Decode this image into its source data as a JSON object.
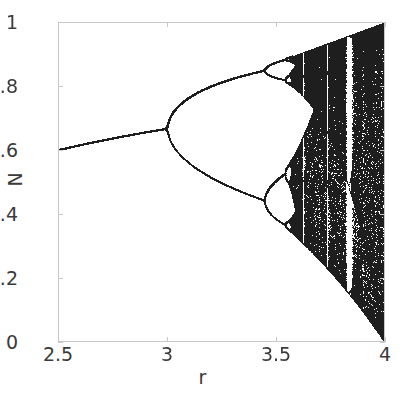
{
  "figure": {
    "background_color": "#ffffff",
    "axis_color": "#c8c8c8",
    "text_color": "#3a3a3a",
    "point_color": "#2a2a2a"
  },
  "chart_data": {
    "type": "scatter",
    "title": "",
    "subtitle": "",
    "xlabel": "r",
    "ylabel": "N",
    "xlim": [
      2.5,
      4
    ],
    "ylim": [
      0,
      1
    ],
    "xticks": [
      2.5,
      3,
      3.5,
      4
    ],
    "xticklabels": [
      "2.5",
      "3",
      "3.5",
      "4"
    ],
    "yticks": [
      0,
      0.2,
      0.4,
      0.6,
      0.8,
      1
    ],
    "yticklabels": [
      "0",
      "0.2",
      "0.4",
      "0.6",
      "0.8",
      "1"
    ],
    "grid": false,
    "legend": null,
    "annotations": [],
    "model": {
      "equation": "N_{n+1} = r * N_n * (1 - N_n)",
      "initial_value": 0.4,
      "transient_iterations": 300,
      "plotted_iterations": 260,
      "r_samples": 1400
    },
    "series": [
      {
        "name": "attractor",
        "marker": "point",
        "color": "#2a2a2a",
        "size": 0.6
      }
    ],
    "reference_points": [
      {
        "label": "fixed point at r=2.5",
        "r": 2.5,
        "N": 0.6
      },
      {
        "label": "first bifurcation",
        "r": 3.0,
        "N": 0.667
      },
      {
        "label": "second bifurcation (period 4)",
        "r": 3.449,
        "N_upper": 0.849,
        "N_lower": 0.44
      },
      {
        "label": "third bifurcation (period 8)",
        "r": 3.544,
        "N_upper": 0.884,
        "N_lower": 0.37
      },
      {
        "label": "Feigenbaum accumulation",
        "r": 3.5699,
        "N": null
      },
      {
        "label": "period-3 window",
        "r": 3.83,
        "N": null
      },
      {
        "label": "full chaos",
        "r": 4.0,
        "N_upper": 1.0,
        "N_lower": 0.0
      }
    ],
    "periodic_windows": [
      {
        "center_r": 3.627,
        "width_r": 0.016,
        "period": 6
      },
      {
        "center_r": 3.702,
        "width_r": 0.008,
        "period": 7
      },
      {
        "center_r": 3.741,
        "width_r": 0.012,
        "period": 5
      },
      {
        "center_r": 3.832,
        "width_r": 0.028,
        "period": 3
      }
    ]
  },
  "axes": {
    "y_labels": [
      {
        "value": 1,
        "text": "1"
      },
      {
        "value": 0.8,
        "text": "0.8"
      },
      {
        "value": 0.6,
        "text": "0.6"
      },
      {
        "value": 0.4,
        "text": "0.4"
      },
      {
        "value": 0.2,
        "text": "0.2"
      },
      {
        "value": 0,
        "text": "0"
      }
    ],
    "x_labels": [
      {
        "value": 2.5,
        "text": "2.5"
      },
      {
        "value": 3,
        "text": "3"
      },
      {
        "value": 3.5,
        "text": "3.5"
      },
      {
        "value": 4,
        "text": "4"
      }
    ],
    "x_title": "r",
    "y_title": "N"
  }
}
